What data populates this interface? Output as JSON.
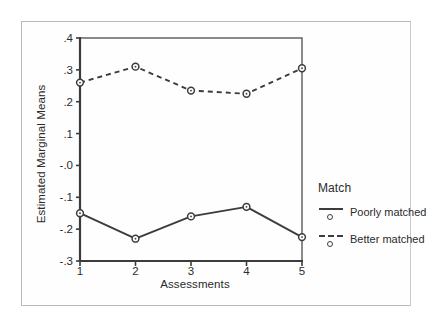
{
  "chart_data": {
    "type": "line",
    "title": "",
    "xlabel": "Assessments",
    "ylabel": "Estimated Marginal Means",
    "categories": [
      "1",
      "2",
      "3",
      "4",
      "5"
    ],
    "x": [
      1,
      2,
      3,
      4,
      5
    ],
    "xlim": [
      1,
      5
    ],
    "ylim": [
      -0.3,
      0.4
    ],
    "grid": false,
    "legend_position": "right",
    "legend_title": "Match",
    "y_tick_labels": [
      ".4",
      ".3",
      ".2",
      ".1",
      "-.0",
      "-.1",
      "-.2",
      "-.3"
    ],
    "y_tick_values": [
      0.4,
      0.3,
      0.2,
      0.1,
      0.0,
      -0.1,
      -0.2,
      -0.3
    ],
    "x_tick_labels": [
      "1",
      "2",
      "3",
      "4",
      "5"
    ],
    "series": [
      {
        "name": "Poorly matched",
        "style": "solid",
        "marker": "circle",
        "color": "#3c3c3c",
        "values": [
          -0.15,
          -0.23,
          -0.16,
          -0.13,
          -0.225
        ]
      },
      {
        "name": "Better matched",
        "style": "dashed",
        "marker": "circle",
        "color": "#3c3c3c",
        "values": [
          0.26,
          0.31,
          0.235,
          0.225,
          0.305
        ]
      }
    ]
  },
  "axes": {
    "y_title": "Estimated Marginal Means",
    "x_title": "Assessments"
  },
  "legend": {
    "title": "Match",
    "entries": [
      {
        "label": "Poorly matched",
        "style": "solid"
      },
      {
        "label": "Better matched",
        "style": "dashed"
      }
    ]
  },
  "colors": {
    "line": "#3c3c3c",
    "axis": "#3c3c3c",
    "frame": "#b9b9b9",
    "text": "#2b2b2b",
    "background": "#ffffff"
  }
}
